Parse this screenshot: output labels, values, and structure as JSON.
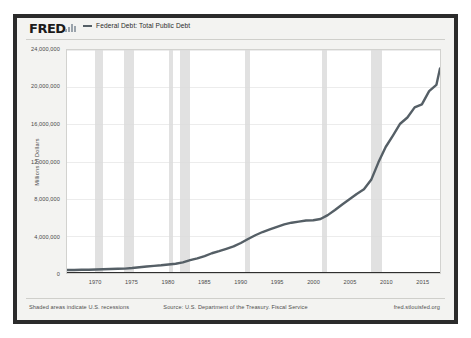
{
  "logo": {
    "text": "FRED",
    "bars_icon": "bar-chart-icon"
  },
  "legend": {
    "series_label": "Federal Debt: Total Public Debt",
    "line_color": "#555f66"
  },
  "colors": {
    "frame": "#2b2b2b",
    "canvas": "#f3f3f1",
    "plot_bg": "#ffffff",
    "recession_band": "#dcdcdc",
    "gridline": "#ececec",
    "axis": "#2f2f2f",
    "text": "#4a4a4a"
  },
  "footer": {
    "left": "Shaded areas indicate U.S. recessions",
    "center": "Source: U.S. Department of the Treasury. Fiscal Service",
    "right": "fred.stlouisfed.org"
  },
  "chart_data": {
    "type": "line",
    "title": "Federal Debt: Total Public Debt",
    "xlabel": "",
    "ylabel": "Millions of Dollars",
    "ylim": [
      0,
      24000000
    ],
    "xlim": [
      1966,
      2017.5
    ],
    "grid": true,
    "legend_position": "top-left",
    "ytick_labels": [
      "0",
      "4,000,000",
      "8,000,000",
      "12,000,000",
      "16,000,000",
      "20,000,000",
      "24,000,000"
    ],
    "ytick_values": [
      0,
      4000000,
      8000000,
      12000000,
      16000000,
      20000000,
      24000000
    ],
    "xtick_labels": [
      "1970",
      "1975",
      "1980",
      "1985",
      "1990",
      "1995",
      "2000",
      "2005",
      "2010",
      "2015"
    ],
    "xtick_values": [
      1970,
      1975,
      1980,
      1985,
      1990,
      1995,
      2000,
      2005,
      2010,
      2015
    ],
    "recessions": [
      {
        "start": 1969.92,
        "end": 1970.92
      },
      {
        "start": 1973.92,
        "end": 1975.25
      },
      {
        "start": 1980.08,
        "end": 1980.58
      },
      {
        "start": 1981.58,
        "end": 1982.92
      },
      {
        "start": 1990.58,
        "end": 1991.25
      },
      {
        "start": 2001.25,
        "end": 2001.92
      },
      {
        "start": 2007.92,
        "end": 2009.5
      }
    ],
    "series": [
      {
        "name": "Federal Debt: Total Public Debt",
        "color": "#555f66",
        "x": [
          1966,
          1967,
          1968,
          1969,
          1970,
          1971,
          1972,
          1973,
          1974,
          1975,
          1976,
          1977,
          1978,
          1979,
          1980,
          1981,
          1982,
          1983,
          1984,
          1985,
          1986,
          1987,
          1988,
          1989,
          1990,
          1991,
          1992,
          1993,
          1994,
          1995,
          1996,
          1997,
          1998,
          1999,
          2000,
          2001,
          2002,
          2003,
          2004,
          2005,
          2006,
          2007,
          2008,
          2009,
          2010,
          2011,
          2012,
          2013,
          2014,
          2015,
          2016,
          2017,
          2017.5
        ],
        "values": [
          320000,
          326000,
          348000,
          354000,
          371000,
          398000,
          427000,
          458000,
          475000,
          533000,
          620000,
          699000,
          772000,
          827000,
          908000,
          998000,
          1142000,
          1377000,
          1572000,
          1823000,
          2125000,
          2350000,
          2602000,
          2857000,
          3233000,
          3665000,
          4065000,
          4411000,
          4693000,
          4974000,
          5225000,
          5413000,
          5526000,
          5656000,
          5674000,
          5807000,
          6228000,
          6783000,
          7379000,
          7933000,
          8507000,
          9008000,
          10025000,
          11910000,
          13562000,
          14790000,
          16066000,
          16738000,
          17824000,
          18151000,
          19573000,
          20245000,
          22000000
        ]
      }
    ]
  }
}
